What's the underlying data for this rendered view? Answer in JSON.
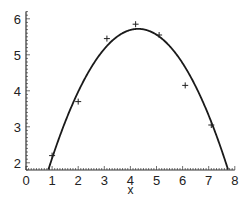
{
  "chart_data": {
    "type": "scatter",
    "title": "",
    "xlabel": "x",
    "ylabel": "",
    "xlim": [
      0,
      8
    ],
    "ylim": [
      1.8,
      6.2
    ],
    "x_ticks": [
      "0",
      "1",
      "2",
      "3",
      "4",
      "5",
      "6",
      "7",
      "8"
    ],
    "y_ticks": [
      "2",
      "3",
      "4",
      "5",
      "6"
    ],
    "grid": false,
    "legend": null,
    "series": [
      {
        "name": "data points",
        "type": "scatter",
        "marker": "+",
        "x": [
          1.0,
          2.0,
          3.1,
          4.2,
          5.1,
          6.1,
          7.1
        ],
        "y": [
          2.2,
          3.7,
          5.45,
          5.85,
          5.55,
          4.15,
          3.05
        ]
      },
      {
        "name": "fitted parabola",
        "type": "line",
        "description": "quadratic fit, vertex near (4.3, 5.72), crosses y=1.8 near x=0.85 and x=7.5"
      }
    ],
    "fit": {
      "vertex_x": 4.3,
      "vertex_y": 5.72,
      "a": -0.33
    }
  },
  "colors": {
    "line": "#1a1a1a",
    "axis": "#333333",
    "background": "#ffffff"
  }
}
